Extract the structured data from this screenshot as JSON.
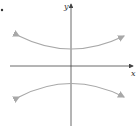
{
  "figure": {
    "marker": "•",
    "x_axis_label": "x",
    "y_axis_label": "y",
    "curve_color": "#a8a8a8",
    "axis_color": "#444444"
  }
}
